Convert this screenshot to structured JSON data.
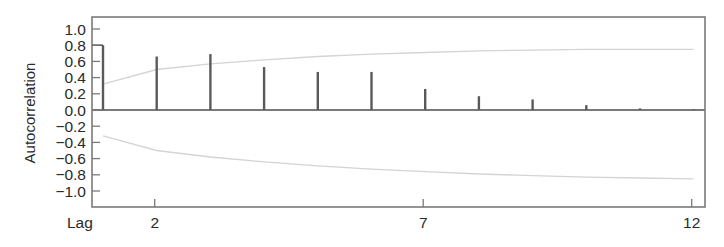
{
  "chart_data": {
    "type": "bar",
    "subtype": "correlogram",
    "title": "",
    "xlabel": "Lag",
    "ylabel": "Autocorrelation",
    "x": [
      1,
      2,
      3,
      4,
      5,
      6,
      7,
      8,
      9,
      10,
      11,
      12
    ],
    "values": [
      0.8,
      0.66,
      0.69,
      0.53,
      0.47,
      0.47,
      0.26,
      0.17,
      0.13,
      0.06,
      0.02,
      0.01
    ],
    "confidence_band": {
      "upper": [
        0.32,
        0.5,
        0.57,
        0.62,
        0.66,
        0.69,
        0.71,
        0.73,
        0.74,
        0.75,
        0.75,
        0.75
      ],
      "lower": [
        -0.32,
        -0.5,
        -0.58,
        -0.64,
        -0.69,
        -0.73,
        -0.76,
        -0.79,
        -0.81,
        -0.83,
        -0.84,
        -0.85
      ]
    },
    "x_ticks": [
      2,
      7,
      12
    ],
    "y_ticks": [
      1.0,
      0.8,
      0.6,
      0.4,
      0.2,
      0.0,
      -0.2,
      -0.4,
      -0.6,
      -0.8,
      -1.0
    ],
    "y_tick_labels": [
      "1.0",
      "0.8",
      "0.6",
      "0.4",
      "0.2",
      "0.0",
      "−0.2",
      "−0.4",
      "−0.6",
      "−0.8",
      "−1.0"
    ],
    "ylim": [
      -1.2,
      1.2
    ],
    "xlim": [
      0.8,
      12.2
    ],
    "grid": false,
    "legend": null,
    "colors": {
      "bars": "#5a5a5a",
      "band": "#d4d4d4",
      "frame": "#7a7a7a",
      "text": "#2a2a2a"
    }
  }
}
